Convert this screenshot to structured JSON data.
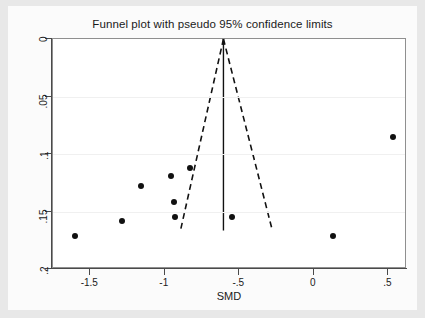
{
  "chart_data": {
    "type": "scatter",
    "title": "Funnel plot with pseudo 95% confidence limits",
    "xlabel": "SMD",
    "ylabel": "",
    "xlim": [
      -1.75,
      0.625
    ],
    "ylim": [
      0,
      0.2
    ],
    "y_inverted": true,
    "grid": true,
    "legend": "none",
    "x_ticks": [
      -1.5,
      -1,
      -0.5,
      0,
      0.5
    ],
    "x_tick_labels": [
      "-1.5",
      "-1",
      "-.5",
      "0",
      ".5"
    ],
    "y_ticks": [
      0,
      0.05,
      0.1,
      0.15,
      0.2
    ],
    "y_tick_labels": [
      "0",
      ".05",
      ".1",
      ".15",
      ".2"
    ],
    "points": [
      {
        "x": -1.6,
        "y": 0.171
      },
      {
        "x": -1.29,
        "y": 0.158
      },
      {
        "x": -1.16,
        "y": 0.128
      },
      {
        "x": -0.96,
        "y": 0.119
      },
      {
        "x": -0.94,
        "y": 0.142
      },
      {
        "x": -0.93,
        "y": 0.155
      },
      {
        "x": -0.83,
        "y": 0.112
      },
      {
        "x": -0.55,
        "y": 0.155
      },
      {
        "x": 0.13,
        "y": 0.171
      },
      {
        "x": 0.53,
        "y": 0.085
      }
    ],
    "pooled_effect_line": {
      "x": -0.6,
      "y_from": 0.0,
      "y_to": 0.168,
      "style": "solid"
    },
    "pseudo_95_limits": {
      "style": "dashed",
      "apex": {
        "x": -0.6,
        "y": 0.0
      },
      "left_end": {
        "x": -0.89,
        "y": 0.168
      },
      "right_end": {
        "x": -0.27,
        "y": 0.168
      }
    }
  }
}
